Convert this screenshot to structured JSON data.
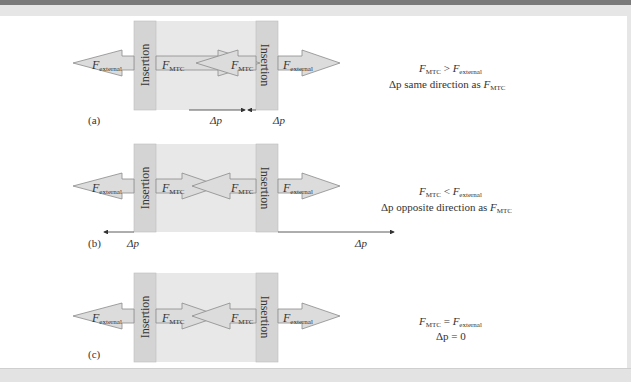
{
  "figure": {
    "insertion_label": "Insertion",
    "force_symbol": "F",
    "external_subscript": "external",
    "mtc_subscript": "MTC",
    "delta_p": "Δp",
    "colors": {
      "insertion_fill": "#d4d4d4",
      "muscle_region_fill": "#e8e8e8",
      "arrow_fill": "#dcdcdc",
      "arrow_stroke": "#8a8a8a",
      "text": "#333333"
    }
  },
  "panels": [
    {
      "label": "(a)",
      "condition_line1": {
        "lhs_sub": "MTC",
        "op": ">",
        "rhs_sub": "external"
      },
      "condition_line2_prefix": "Δp same direction as ",
      "condition_line2_sub": "MTC",
      "delta_p_labels": [
        "Δp",
        "Δp"
      ],
      "delta_p_direction": "inward"
    },
    {
      "label": "(b)",
      "condition_line1": {
        "lhs_sub": "MTC",
        "op": "<",
        "rhs_sub": "external"
      },
      "condition_line2_prefix": "Δp opposite direction as ",
      "condition_line2_sub": "MTC",
      "delta_p_labels": [
        "Δp",
        "Δp"
      ],
      "delta_p_direction": "outward"
    },
    {
      "label": "(c)",
      "condition_line1": {
        "lhs_sub": "MTC",
        "op": "=",
        "rhs_sub": "external"
      },
      "condition_line2_prefix": "Δp = 0",
      "condition_line2_sub": "",
      "delta_p_labels": [],
      "delta_p_direction": "none"
    }
  ]
}
